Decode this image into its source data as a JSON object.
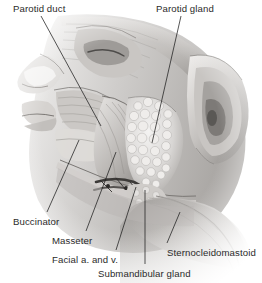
{
  "figure": {
    "name": "lateral-face-salivary-glands",
    "background_color": "#ffffff",
    "ink_color": "#2b2b2b",
    "leader_color": "#1d1d1d",
    "style": "grayscale anatomical illustration"
  },
  "labels": [
    {
      "id": "parotid-duct",
      "text": "Parotid duct",
      "x": 13,
      "y": 3,
      "anchor": "start"
    },
    {
      "id": "parotid-gland",
      "text": "Parotid gland",
      "x": 156,
      "y": 3,
      "anchor": "start"
    },
    {
      "id": "buccinator",
      "text": "Buccinator",
      "x": 13,
      "y": 216,
      "anchor": "start"
    },
    {
      "id": "masseter",
      "text": "Masseter",
      "x": 52,
      "y": 235,
      "anchor": "start"
    },
    {
      "id": "facial-vessels",
      "text": "Facial a. and v.",
      "x": 52,
      "y": 254,
      "anchor": "start"
    },
    {
      "id": "submandibular-gland",
      "text": "Submandibular gland",
      "x": 98,
      "y": 268,
      "anchor": "start"
    },
    {
      "id": "sternocleidomastoid",
      "text": "Sternocleidomastoid",
      "x": 167,
      "y": 247,
      "anchor": "start"
    }
  ],
  "leaders": [
    {
      "id": "leader-parotid-duct",
      "x1": 41,
      "y1": 16,
      "x2": 101,
      "y2": 126
    },
    {
      "id": "leader-parotid-gland",
      "x1": 181,
      "y1": 16,
      "x2": 152,
      "y2": 143
    },
    {
      "id": "leader-buccinator",
      "x1": 47,
      "y1": 212,
      "x2": 79,
      "y2": 140
    },
    {
      "id": "leader-masseter",
      "x1": 86,
      "y1": 231,
      "x2": 116,
      "y2": 152
    },
    {
      "id": "leader-facial-vessels",
      "x1": 116,
      "y1": 250,
      "x2": 136,
      "y2": 187
    },
    {
      "id": "leader-submandibular-gland",
      "x1": 145,
      "y1": 264,
      "x2": 145,
      "y2": 190
    },
    {
      "id": "leader-sternocleidomastoid",
      "x1": 167,
      "y1": 243,
      "x2": 180,
      "y2": 212
    }
  ],
  "structures": [
    {
      "id": "nose",
      "name": "nose-profile"
    },
    {
      "id": "lips",
      "name": "lips"
    },
    {
      "id": "orbit",
      "name": "orbital-region"
    },
    {
      "id": "temporalis",
      "name": "temporalis-fascia"
    },
    {
      "id": "ear",
      "name": "auricle"
    },
    {
      "id": "parotid-gland-body",
      "name": "parotid-gland-lobules"
    },
    {
      "id": "masseter-body",
      "name": "masseter-muscle"
    },
    {
      "id": "buccinator-body",
      "name": "buccinator-muscle"
    },
    {
      "id": "submandibular-body",
      "name": "submandibular-gland"
    },
    {
      "id": "facial-vessels-body",
      "name": "facial-artery-and-vein"
    },
    {
      "id": "scm-body",
      "name": "sternocleidomastoid-muscle"
    },
    {
      "id": "mandible",
      "name": "mandible-border"
    }
  ]
}
